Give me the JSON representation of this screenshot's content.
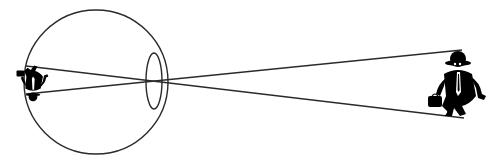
{
  "diagram": {
    "type": "eye-optics",
    "description": "Eye forming an inverted image of an object on the retina",
    "colors": {
      "stroke": "#2a2a2a",
      "fill": "#000000",
      "background": "#ffffff"
    },
    "eyeball": {
      "cx": 96,
      "cy": 82,
      "r": 72
    },
    "lens": {
      "cx": 154,
      "cy": 81,
      "rx": 8,
      "ry": 28
    },
    "rays": [
      {
        "name": "top-ray",
        "x1": 26,
        "y1": 94,
        "x2": 462,
        "y2": 50
      },
      {
        "name": "bottom-ray",
        "x1": 26,
        "y1": 66,
        "x2": 464,
        "y2": 118
      }
    ],
    "object": {
      "label": "object-figure",
      "x": 418,
      "y": 46
    },
    "image": {
      "label": "inverted-retinal-image",
      "x": 18,
      "y": 62
    }
  }
}
